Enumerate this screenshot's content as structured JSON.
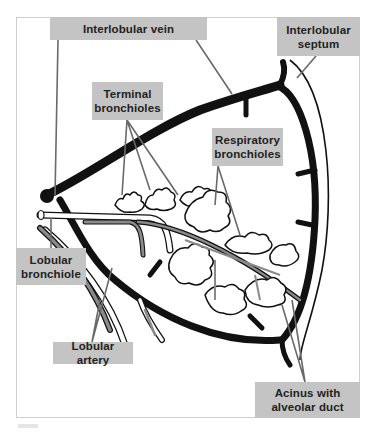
{
  "diagram": {
    "colors": {
      "label_bg": "#c4c4c4",
      "label_text": "#222222",
      "vein": "#111111",
      "artery": "#8a8a8a",
      "bronchiole_fill": "#ffffff",
      "leader_line": "#6a6a6a",
      "frame": "#cfcfcf"
    },
    "labels": {
      "interlobular_vein": {
        "line1": "Interlobular vein"
      },
      "interlobular_septum": {
        "line1": "Interlobular",
        "line2": "septum"
      },
      "terminal_bronchioles": {
        "line1": "Terminal",
        "line2": "bronchioles"
      },
      "respiratory_bronchioles": {
        "line1": "Respiratory",
        "line2": "bronchioles"
      },
      "lobular_bronchiole": {
        "line1": "Lobular",
        "line2": "bronchiole"
      },
      "lobular_artery": {
        "line1": "Lobular artery"
      },
      "acinus": {
        "line1": "Acinus with",
        "line2": "alveolar duct"
      }
    }
  }
}
